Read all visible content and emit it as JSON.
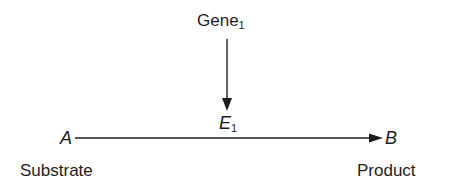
{
  "diagram": {
    "type": "enzyme-reaction",
    "gene": {
      "label": "Gene",
      "subscript": "1"
    },
    "enzyme": {
      "label": "E",
      "subscript": "1"
    },
    "substrate": {
      "symbol": "A",
      "label": "Substrate"
    },
    "product": {
      "symbol": "B",
      "label": "Product"
    },
    "edges": [
      {
        "from": "Gene1",
        "to": "E1",
        "direction": "down"
      },
      {
        "from": "A",
        "to": "B",
        "direction": "right"
      }
    ],
    "colors": {
      "stroke": "#1e1e1e",
      "background": "#ffffff"
    }
  }
}
